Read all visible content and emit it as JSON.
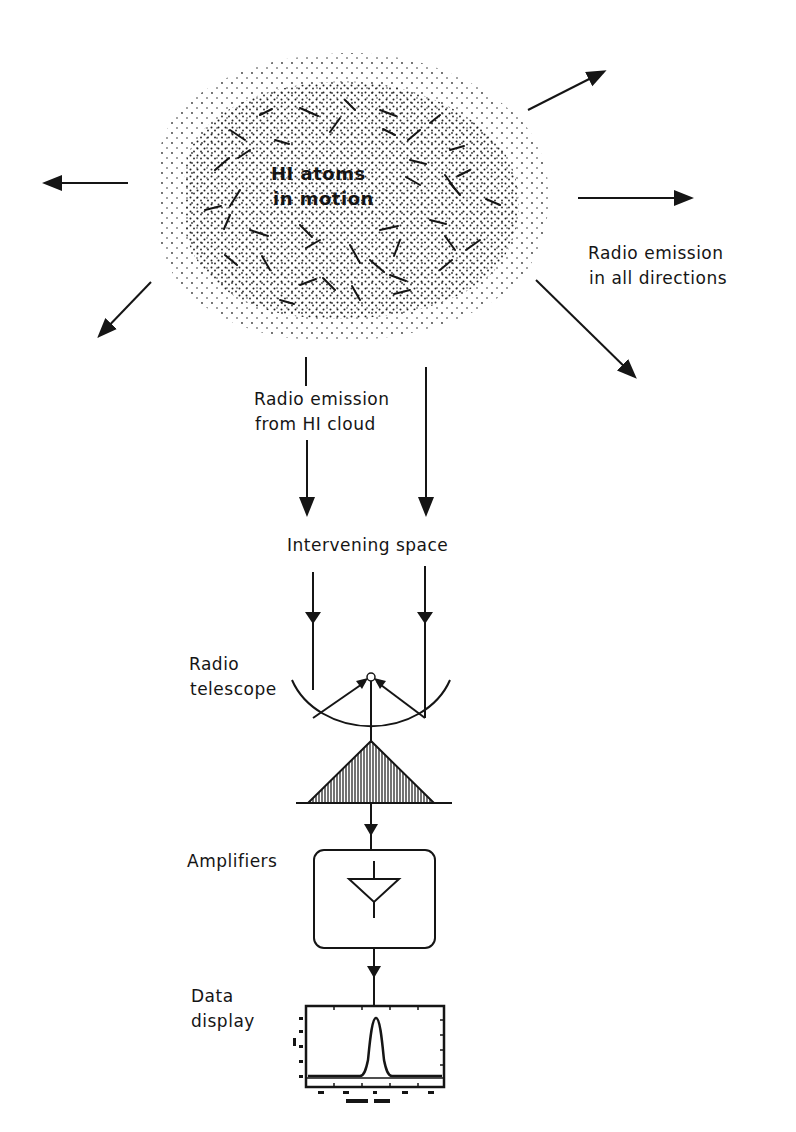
{
  "diagram": {
    "cloud": {
      "label_line1": "HI atoms",
      "label_line2": "in motion",
      "icon": "hydrogen-cloud"
    },
    "emission_all_directions": {
      "label_line1": "Radio emission",
      "label_line2": "in all directions",
      "arrows": [
        "up-right",
        "right",
        "down-right",
        "left",
        "down-left"
      ]
    },
    "emission_from_cloud": {
      "label_line1": "Radio emission",
      "label_line2": "from HI cloud"
    },
    "intervening_space": {
      "label": "Intervening space"
    },
    "telescope": {
      "label_line1": "Radio",
      "label_line2": "telescope",
      "icon": "parabolic-dish"
    },
    "amplifiers": {
      "label": "Amplifiers",
      "icon": "amplifier-triangle"
    },
    "data_display": {
      "label_line1": "Data",
      "label_line2": "display",
      "icon": "spectrum-plot"
    },
    "colors": {
      "ink": "#151515",
      "background": "#ffffff"
    }
  }
}
